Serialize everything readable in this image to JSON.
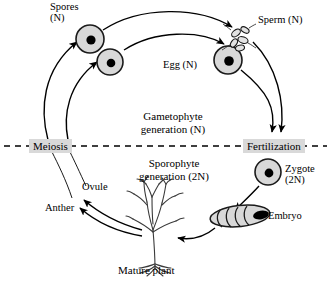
{
  "diagram": {
    "background_color": "#ffffff",
    "line_color": "#000000",
    "cell_fill_color": "#d8d8d8",
    "highlight_color": "#d9d9d9",
    "labels": {
      "spores": "Spores\n(N)",
      "sperm": "Sperm (N)",
      "egg": "Egg (N)",
      "gametophyte": "Gametophyte\ngeneration (N)",
      "sporophyte": "Sporophyte\ngeneration (2N)",
      "meiosis": "Meiosis",
      "fertilization": "Fertilization",
      "zygote": "Zygote\n(2N)",
      "embryo": "Embryo",
      "ovule": "Ovule",
      "anther": "Anther",
      "mature_plant": "Mature plant"
    },
    "structures": [
      {
        "name": "spore-cell-upper",
        "kind": "haploid-cell",
        "ploidy": "N"
      },
      {
        "name": "spore-cell-lower",
        "kind": "haploid-cell",
        "ploidy": "N"
      },
      {
        "name": "egg-cell",
        "kind": "haploid-cell",
        "ploidy": "N"
      },
      {
        "name": "sperm-cells",
        "kind": "haploid-cell-cluster",
        "ploidy": "N"
      },
      {
        "name": "zygote-cell",
        "kind": "diploid-cell",
        "ploidy": "2N"
      },
      {
        "name": "embryo",
        "kind": "segmented-embryo",
        "ploidy": "2N"
      },
      {
        "name": "mature-plant",
        "kind": "plant-sketch",
        "ploidy": "2N"
      }
    ],
    "flow": [
      {
        "from": "meiosis",
        "to": "spores"
      },
      {
        "from": "spores",
        "to": "sperm"
      },
      {
        "from": "spores",
        "to": "egg"
      },
      {
        "from": "sperm",
        "to": "fertilization"
      },
      {
        "from": "egg",
        "to": "fertilization"
      },
      {
        "from": "fertilization",
        "to": "zygote"
      },
      {
        "from": "zygote",
        "to": "embryo"
      },
      {
        "from": "embryo",
        "to": "mature-plant"
      },
      {
        "from": "mature-plant",
        "to": "ovule"
      },
      {
        "from": "mature-plant",
        "to": "anther"
      }
    ]
  }
}
